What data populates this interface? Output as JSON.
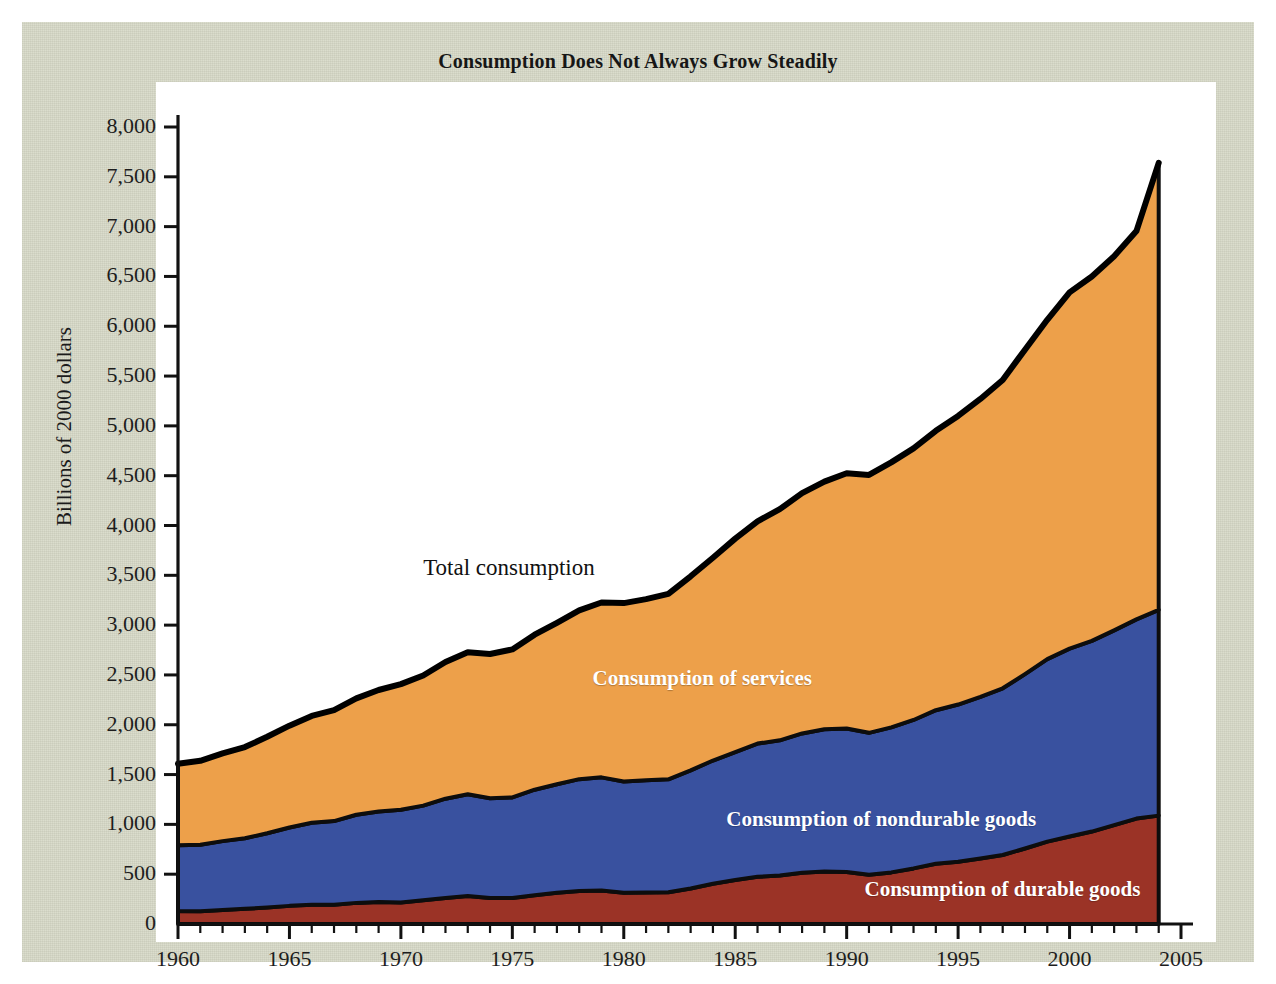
{
  "figure": {
    "title": "Consumption Does Not Always Grow Steadily",
    "panel_color": "#d9dbc9",
    "plot_bg": "#ffffff"
  },
  "annotations": {
    "total": "Total consumption",
    "services": "Consumption of services",
    "nondurable": "Consumption of nondurable goods",
    "durable": "Consumption of durable goods"
  },
  "chart_data": {
    "type": "area",
    "title": "Consumption Does Not Always Grow Steadily",
    "xlabel": "",
    "ylabel": "Billions of 2000 dollars",
    "stacked": true,
    "grid": false,
    "legend_position": "inline-annotations",
    "xlim": [
      1960,
      2005
    ],
    "ylim": [
      0,
      8000
    ],
    "xticks": [
      1960,
      1965,
      1970,
      1975,
      1980,
      1985,
      1990,
      1995,
      2000,
      2005
    ],
    "xtick_labels": [
      "1960",
      "1965",
      "1970",
      "1975",
      "1980",
      "1985",
      "1990",
      "1995",
      "2000",
      "2005"
    ],
    "yticks": [
      0,
      500,
      1000,
      1500,
      2000,
      2500,
      3000,
      3500,
      4000,
      4500,
      5000,
      5500,
      6000,
      6500,
      7000,
      7500,
      8000
    ],
    "ytick_labels": [
      "0",
      "500",
      "1,000",
      "1,500",
      "2,000",
      "2,500",
      "3,000",
      "3,500",
      "4,000",
      "4,500",
      "5,000",
      "5,500",
      "6,000",
      "6,500",
      "7,000",
      "7,500",
      "8,000"
    ],
    "x": [
      1960,
      1961,
      1962,
      1963,
      1964,
      1965,
      1966,
      1967,
      1968,
      1969,
      1970,
      1971,
      1972,
      1973,
      1974,
      1975,
      1976,
      1977,
      1978,
      1979,
      1980,
      1981,
      1982,
      1983,
      1984,
      1985,
      1986,
      1987,
      1988,
      1989,
      1990,
      1991,
      1992,
      1993,
      1994,
      1995,
      1996,
      1997,
      1998,
      1999,
      2000,
      2001,
      2002,
      2003,
      2004
    ],
    "series": [
      {
        "name": "Consumption of durable goods",
        "color": "#9b3326",
        "values": [
          130,
          128,
          140,
          152,
          166,
          182,
          192,
          193,
          212,
          220,
          216,
          238,
          262,
          281,
          262,
          262,
          288,
          313,
          332,
          337,
          314,
          317,
          318,
          356,
          404,
          441,
          474,
          487,
          514,
          527,
          523,
          495,
          518,
          558,
          604,
          625,
          657,
          693,
          758,
          827,
          878,
          928,
          992,
          1058,
          1088
        ]
      },
      {
        "name": "Consumption of nondurable goods",
        "color": "#39519f",
        "values": [
          660,
          668,
          692,
          708,
          745,
          786,
          824,
          840,
          885,
          910,
          930,
          950,
          996,
          1022,
          1000,
          1009,
          1060,
          1090,
          1122,
          1135,
          1117,
          1126,
          1134,
          1186,
          1237,
          1284,
          1337,
          1357,
          1399,
          1428,
          1440,
          1424,
          1456,
          1490,
          1542,
          1578,
          1622,
          1673,
          1751,
          1832,
          1886,
          1914,
          1955,
          2000,
          2065
        ]
      },
      {
        "name": "Consumption of services",
        "color": "#eda04a",
        "values": [
          818,
          842,
          880,
          916,
          968,
          1023,
          1073,
          1114,
          1168,
          1219,
          1262,
          1306,
          1372,
          1424,
          1448,
          1485,
          1556,
          1620,
          1694,
          1755,
          1790,
          1818,
          1862,
          1948,
          2036,
          2143,
          2231,
          2320,
          2412,
          2485,
          2561,
          2589,
          2660,
          2726,
          2804,
          2897,
          2991,
          3094,
          3256,
          3406,
          3576,
          3658,
          3756,
          3897,
          4487
        ]
      }
    ],
    "total_series": {
      "name": "Total consumption",
      "color": "#000000",
      "values": [
        1608,
        1638,
        1712,
        1776,
        1879,
        1991,
        2089,
        2147,
        2265,
        2349,
        2408,
        2494,
        2630,
        2727,
        2710,
        2756,
        2904,
        3023,
        3148,
        3227,
        3221,
        3261,
        3314,
        3490,
        3677,
        3868,
        4042,
        4164,
        4325,
        4440,
        4524,
        4508,
        4634,
        4774,
        4950,
        5100,
        5270,
        5460,
        5765,
        6065,
        6340,
        6500,
        6703,
        6955,
        7640
      ]
    }
  }
}
